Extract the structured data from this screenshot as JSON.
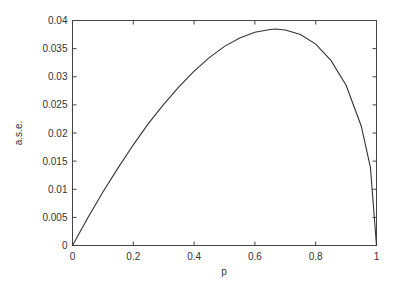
{
  "chart_data": {
    "type": "line",
    "title": "",
    "xlabel": "p",
    "ylabel": "a.s.e.",
    "xlim": [
      0,
      1
    ],
    "ylim": [
      0,
      0.04
    ],
    "xticks": [
      "0",
      "0.2",
      "0.4",
      "0.6",
      "0.8",
      "1"
    ],
    "yticks": [
      "0",
      "0.005",
      "0.01",
      "0.015",
      "0.02",
      "0.025",
      "0.03",
      "0.035",
      "0.04"
    ],
    "grid": false,
    "legend": null,
    "series": [
      {
        "name": "a.s.e.",
        "x": [
          0,
          0.05,
          0.1,
          0.15,
          0.2,
          0.25,
          0.3,
          0.35,
          0.4,
          0.45,
          0.5,
          0.55,
          0.6,
          0.65,
          0.667,
          0.7,
          0.75,
          0.8,
          0.85,
          0.9,
          0.95,
          0.98,
          1.0
        ],
        "values": [
          0,
          0.0049,
          0.0095,
          0.0138,
          0.0179,
          0.0217,
          0.0251,
          0.0282,
          0.031,
          0.0334,
          0.0354,
          0.0369,
          0.0379,
          0.0384,
          0.0385,
          0.0383,
          0.0375,
          0.0358,
          0.0329,
          0.0285,
          0.0212,
          0.0139,
          0
        ]
      }
    ],
    "colors": {
      "line": "#333333",
      "axes": "#333333"
    }
  }
}
